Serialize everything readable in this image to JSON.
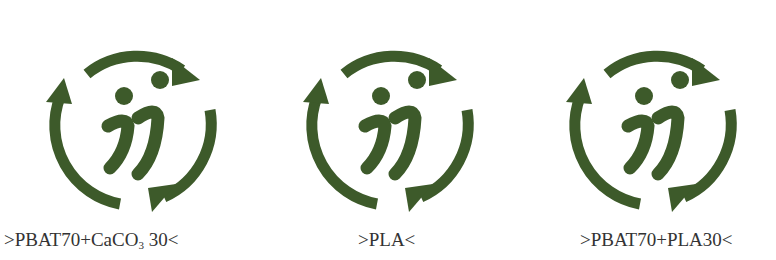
{
  "theme": {
    "logo_color": "#3d5a2a",
    "text_color": "#333333"
  },
  "logos": [
    {
      "name": "PBAT70+CaCO3 30",
      "label_prefix": ">PBAT70+CaCO",
      "label_sub": "3",
      "label_suffix": " 30<"
    },
    {
      "name": "PLA",
      "label_prefix": ">PLA<",
      "label_sub": "",
      "label_suffix": ""
    },
    {
      "name": "PBAT70+PLA30",
      "label_prefix": ">PBAT70+PLA30<",
      "label_sub": "",
      "label_suffix": ""
    }
  ],
  "icon": "recycle-jj-logo-icon"
}
